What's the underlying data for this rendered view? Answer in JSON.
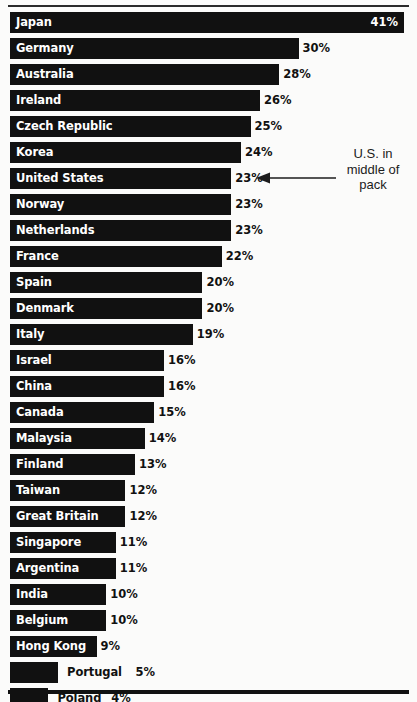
{
  "chart_data": {
    "type": "bar",
    "orientation": "horizontal",
    "title": "",
    "xlabel": "",
    "ylabel": "",
    "xlim": [
      0,
      41
    ],
    "grid": false,
    "legend": false,
    "value_suffix": "%",
    "categories": [
      "Japan",
      "Germany",
      "Australia",
      "Ireland",
      "Czech Republic",
      "Korea",
      "United States",
      "Norway",
      "Netherlands",
      "France",
      "Spain",
      "Denmark",
      "Italy",
      "Israel",
      "China",
      "Canada",
      "Malaysia",
      "Finland",
      "Taiwan",
      "Great Britain",
      "Singapore",
      "Argentina",
      "India",
      "Belgium",
      "Hong Kong",
      "Portugal",
      "Poland"
    ],
    "values": [
      41,
      30,
      28,
      26,
      25,
      24,
      23,
      23,
      23,
      22,
      20,
      20,
      19,
      16,
      16,
      15,
      14,
      13,
      12,
      12,
      11,
      11,
      10,
      10,
      9,
      5,
      4
    ],
    "value_labels": [
      "41%",
      "30%",
      "28%",
      "26%",
      "25%",
      "24%",
      "23%",
      "23%",
      "23%",
      "22%",
      "20%",
      "20%",
      "19%",
      "16%",
      "16%",
      "15%",
      "14%",
      "13%",
      "12%",
      "12%",
      "11%",
      "11%",
      "10%",
      "10%",
      "9%",
      "5%",
      "4%"
    ],
    "bar_color": "#111111",
    "inside_label_color": "#ffffff",
    "outside_label_color": "#111111",
    "background_color": "#fbfbfa"
  },
  "annotation": {
    "line1": "U.S. in",
    "line2": "middle of",
    "line3": "pack",
    "points_to": "United States",
    "arrow": "left-arrow-icon"
  }
}
